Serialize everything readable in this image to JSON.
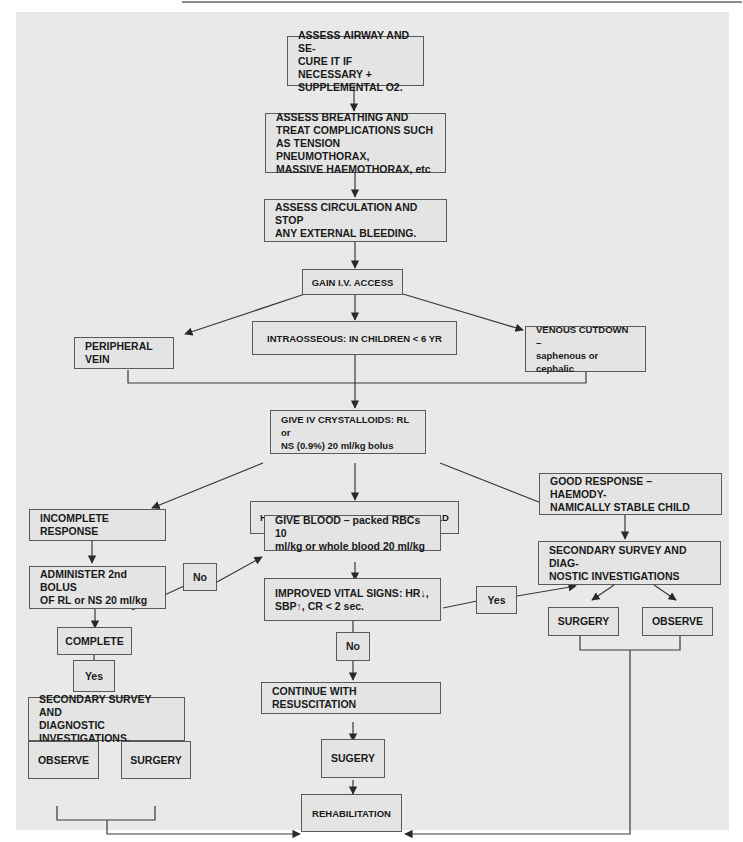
{
  "figure": {
    "type": "flowchart",
    "colors": {
      "panel_bg": "#e9e9e9",
      "box_bg": "#e4e4e4",
      "box_border": "#5a5a5a",
      "line": "#3a3a3a",
      "text": "#1a1a1a"
    }
  },
  "nodes": {
    "airway": {
      "label": "ASSESS AIRWAY AND SE-\nCURE IT IF NECESSARY +\nSUPPLEMENTAL O2."
    },
    "breathing": {
      "label": "ASSESS BREATHING AND\nTREAT COMPLICATIONS SUCH\nAS TENSION PNEUMOTHORAX,\nMASSIVE HAEMOTHORAX, etc"
    },
    "circulation": {
      "label": "ASSESS CIRCULATION AND STOP\nANY EXTERNAL BLEEDING."
    },
    "iv_access": {
      "label": "GAIN I.V. ACCESS"
    },
    "peripheral": {
      "label": "PERIPHERAL VEIN"
    },
    "intraosseous": {
      "label": "INTRAOSSEOUS: IN CHILDREN < 6 YR"
    },
    "cutdown": {
      "label": "VENOUS CUTDOWN –\nsaphenous or cephalic"
    },
    "crystalloids": {
      "label": "GIVE IV CRYSTALLOIDS: RL or\nNS (0.9%) 20 ml/kg bolus"
    },
    "incomplete": {
      "label": "INCOMPLETE RESPONSE"
    },
    "unstable": {
      "label": "HAEMODYNAMICALLY UNSTABLE CHILD"
    },
    "good": {
      "label": "GOOD RESPONSE – HAEMODY-\nNAMICALLY STABLE CHILD"
    },
    "bolus2": {
      "label": "ADMINISTER 2nd BOLUS\nOF RL or NS 20 ml/kg"
    },
    "blood": {
      "label": "GIVE BLOOD – packed RBCs 10\nml/kg or whole blood 20 ml/kg"
    },
    "secondary_r": {
      "label": "SECONDARY SURVEY AND DIAG-\nNOSTIC INVESTIGATIONS"
    },
    "complete": {
      "label": "COMPLETE"
    },
    "no_left": {
      "label": "No"
    },
    "vitals": {
      "label": "IMPROVED VITAL SIGNS: HR↓,\nSBP↑, CR < 2 sec."
    },
    "yes_right": {
      "label": "Yes"
    },
    "surgery_r": {
      "label": "SURGERY"
    },
    "observe_r": {
      "label": "OBSERVE"
    },
    "yes_left": {
      "label": "Yes"
    },
    "no_center": {
      "label": "No"
    },
    "secondary_l": {
      "label": "SECONDARY SURVEY AND\nDIAGNOSTIC INVESTIGATIONS."
    },
    "continue": {
      "label": "CONTINUE WITH RESUSCITATION"
    },
    "observe_l": {
      "label": "OBSERVE"
    },
    "surgery_l": {
      "label": "SURGERY"
    },
    "sugery_c": {
      "label": "SUGERY"
    },
    "rehab": {
      "label": "REHABILITATION"
    }
  },
  "edges": [
    [
      "airway",
      "breathing"
    ],
    [
      "breathing",
      "circulation"
    ],
    [
      "circulation",
      "iv_access"
    ],
    [
      "iv_access",
      "peripheral"
    ],
    [
      "iv_access",
      "intraosseous"
    ],
    [
      "iv_access",
      "cutdown"
    ],
    [
      "peripheral",
      "crystalloids"
    ],
    [
      "intraosseous",
      "crystalloids"
    ],
    [
      "cutdown",
      "crystalloids"
    ],
    [
      "crystalloids",
      "incomplete"
    ],
    [
      "crystalloids",
      "unstable"
    ],
    [
      "crystalloids",
      "good"
    ],
    [
      "incomplete",
      "bolus2"
    ],
    [
      "bolus2",
      "complete"
    ],
    [
      "complete",
      "no_left"
    ],
    [
      "no_left",
      "blood"
    ],
    [
      "complete",
      "yes_left"
    ],
    [
      "yes_left",
      "secondary_l"
    ],
    [
      "secondary_l",
      "observe_l"
    ],
    [
      "secondary_l",
      "surgery_l"
    ],
    [
      "observe_l",
      "rehab"
    ],
    [
      "surgery_l",
      "rehab"
    ],
    [
      "unstable",
      "blood"
    ],
    [
      "blood",
      "vitals"
    ],
    [
      "vitals",
      "yes_right"
    ],
    [
      "yes_right",
      "secondary_r"
    ],
    [
      "vitals",
      "no_center"
    ],
    [
      "no_center",
      "continue"
    ],
    [
      "continue",
      "sugery_c"
    ],
    [
      "sugery_c",
      "rehab"
    ],
    [
      "good",
      "secondary_r"
    ],
    [
      "secondary_r",
      "surgery_r"
    ],
    [
      "secondary_r",
      "observe_r"
    ],
    [
      "surgery_r",
      "rehab"
    ],
    [
      "observe_r",
      "rehab"
    ]
  ]
}
